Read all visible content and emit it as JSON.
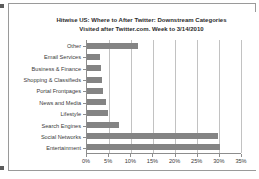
{
  "chart_data": {
    "type": "bar",
    "orientation": "horizontal",
    "title_lines": [
      "Hitwise US: Where to After Twitter: Downstream Categories",
      "Visited after Twitter.com. Week to 3/14/2010"
    ],
    "title": "Hitwise US: Where to After Twitter: Downstream Categories Visited after Twitter.com. Week to 3/14/2010",
    "xlabel": "",
    "ylabel": "",
    "categories": [
      "Other",
      "Email Services",
      "Business & Finance",
      "Shopping & Classifieds",
      "Portal Frontpages",
      "News and Media",
      "Lifestyle",
      "Search Engines",
      "Social Networks",
      "Entertainment"
    ],
    "values": [
      11.5,
      3.0,
      3.1,
      3.4,
      3.6,
      4.4,
      4.8,
      7.2,
      29.8,
      30.2
    ],
    "value_suffix": "%",
    "xlim": [
      0,
      35
    ],
    "xticks": [
      0,
      5,
      10,
      15,
      20,
      25,
      30,
      35
    ],
    "xtick_labels": [
      "0%",
      "5%",
      "10%",
      "15%",
      "20%",
      "25%",
      "30%",
      "35%"
    ],
    "grid": "vertical",
    "legend": "none",
    "bar_color": "#848484",
    "axis_color": "#8d8d8d",
    "gridline_color": "#c2c2c2",
    "background": "#ffffff"
  }
}
